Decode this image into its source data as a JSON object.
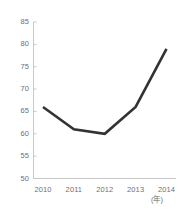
{
  "chart_data": {
    "type": "line",
    "title": "",
    "subtitle": "",
    "xlabel": "",
    "ylabel": "",
    "x_unit": "(年)",
    "categories": [
      "2010",
      "2011",
      "2012",
      "2013",
      "2014"
    ],
    "values": [
      66,
      61,
      60,
      66,
      79
    ],
    "series": [
      {
        "name": "",
        "values": [
          66,
          61,
          60,
          66,
          79
        ]
      }
    ],
    "ylim": [
      50,
      85
    ],
    "y_ticks": [
      "50",
      "55",
      "60",
      "65",
      "70",
      "75",
      "80",
      "85"
    ],
    "y_tick_values": [
      50,
      55,
      60,
      65,
      70,
      75,
      80,
      85
    ],
    "grid": false,
    "legend": "none",
    "line_color": "#333333",
    "axis_color": "#c8c8c8",
    "tick_label_color": "#6f6f6f",
    "background": "#ffffff",
    "line_width": 2.6,
    "markers": false
  }
}
